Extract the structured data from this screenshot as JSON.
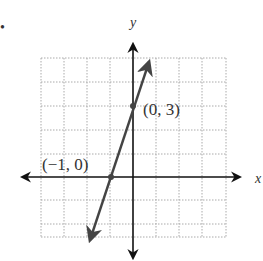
{
  "figure": {
    "bullet": "•",
    "x_axis_label": "x",
    "y_axis_label": "y",
    "points": [
      {
        "label": "(0, 3)",
        "x": 0,
        "y": 3
      },
      {
        "label": "(−1, 0)",
        "x": -1,
        "y": 0
      }
    ],
    "line": {
      "slope": 3,
      "intercept": 3,
      "equation": "y = 3x + 3"
    },
    "grid": {
      "x_range": [
        -4,
        4
      ],
      "y_range": [
        -3,
        5
      ],
      "style": "dotted"
    },
    "colors": {
      "axis": "#111111",
      "line": "#444444",
      "grid": "#aaaaaa",
      "text": "#333333"
    }
  }
}
